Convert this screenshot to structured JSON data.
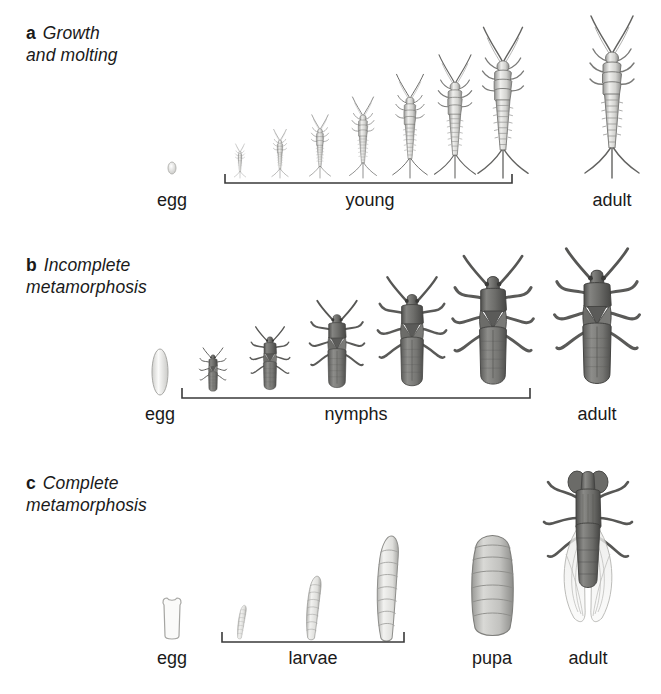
{
  "figure": {
    "kind": "insect-development-diagram",
    "background": "#ffffff",
    "ink": "#1a1a1a"
  },
  "panels": [
    {
      "id": "a",
      "letter": "a",
      "title_line1": "Growth",
      "title_line2": "and molting",
      "stages": [
        {
          "name": "egg",
          "label": "egg",
          "label_x": 172,
          "count": 1
        },
        {
          "name": "young",
          "label": "young",
          "label_x": 370,
          "count": 7,
          "bracket": {
            "x1": 225,
            "x2": 512
          }
        },
        {
          "name": "adult",
          "label": "adult",
          "label_x": 612,
          "count": 1
        }
      ],
      "organism": "silverfish"
    },
    {
      "id": "b",
      "letter": "b",
      "title_line1": "Incomplete",
      "title_line2": "metamorphosis",
      "stages": [
        {
          "name": "egg",
          "label": "egg",
          "label_x": 160,
          "count": 1
        },
        {
          "name": "nymphs",
          "label": "nymphs",
          "label_x": 356,
          "count": 5,
          "bracket": {
            "x1": 182,
            "x2": 530
          }
        },
        {
          "name": "adult",
          "label": "adult",
          "label_x": 597,
          "count": 1
        }
      ],
      "organism": "true-bug"
    },
    {
      "id": "c",
      "letter": "c",
      "title_line1": "Complete",
      "title_line2": "metamorphosis",
      "stages": [
        {
          "name": "egg",
          "label": "egg",
          "label_x": 172,
          "count": 1
        },
        {
          "name": "larvae",
          "label": "larvae",
          "label_x": 313,
          "count": 3,
          "bracket": {
            "x1": 222,
            "x2": 404
          }
        },
        {
          "name": "pupa",
          "label": "pupa",
          "label_x": 492,
          "count": 1
        },
        {
          "name": "adult",
          "label": "adult",
          "label_x": 588,
          "count": 1
        }
      ],
      "organism": "fly"
    }
  ],
  "colors": {
    "outline_light": "#8a8a8a",
    "outline_dark": "#4a4a4a",
    "body_fill_light": "#e8e8e6",
    "body_fill_mid": "#b9b9b6",
    "body_fill_dark": "#6f6f6f",
    "bracket": "#3a3a3a"
  }
}
